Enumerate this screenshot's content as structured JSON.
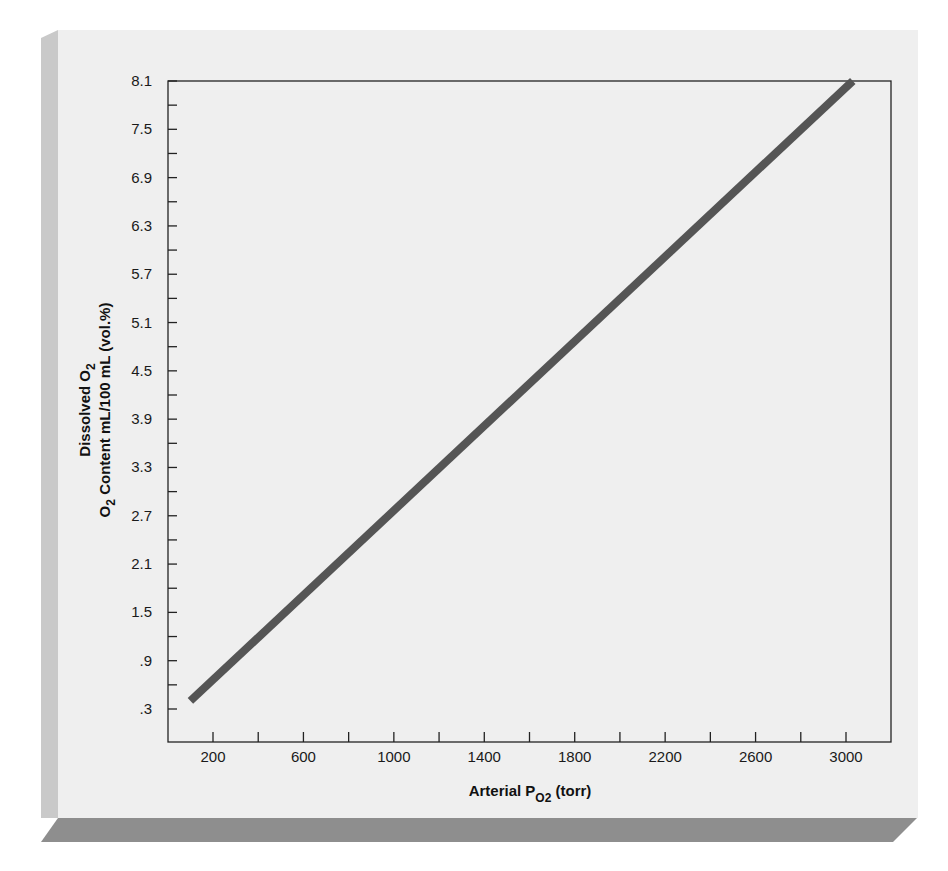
{
  "chart_data": {
    "type": "line",
    "title": "",
    "xlabel": "Arterial PO2 (torr)",
    "ylabel": "Dissolved O2 / O2 Content mL/100 mL (vol.%)",
    "xlabel_parts": {
      "main": "Arterial P",
      "sub": "O2",
      "tail": " (torr)"
    },
    "ylabel_line1": {
      "main": "Dissolved O",
      "sub": "2"
    },
    "ylabel_line2": {
      "main": "O",
      "sub": "2",
      "tail": " Content mL/100 mL (vol.%)"
    },
    "x_tick_labels": [
      "200",
      "600",
      "1000",
      "1400",
      "1800",
      "2200",
      "2600",
      "3000"
    ],
    "x_minor_ticks": [
      400,
      800,
      1200,
      1600,
      2000,
      2400,
      2800
    ],
    "y_tick_labels": [
      "8.1",
      "7.5",
      "6.9",
      "6.3",
      "5.7",
      "5.1",
      "4.5",
      "3.9",
      "3.3",
      "2.7",
      "2.1",
      "1.5",
      ".9",
      ".3"
    ],
    "xlim": [
      -100,
      3200
    ],
    "ylim": [
      -0.1,
      8.1
    ],
    "grid": false,
    "legend": null,
    "series": [
      {
        "name": "Dissolved O2",
        "color": "#555555",
        "x": [
          100,
          3030
        ],
        "y": [
          0.4,
          8.1
        ]
      }
    ],
    "relationship": "linear, ~0.003 mL O2 /100 mL blood per torr"
  },
  "colors": {
    "panel": "#efefef",
    "panel_side": "#c9c9c9",
    "panel_bottom": "#8e8e8e",
    "line": "#555555",
    "axis": "#222222"
  }
}
